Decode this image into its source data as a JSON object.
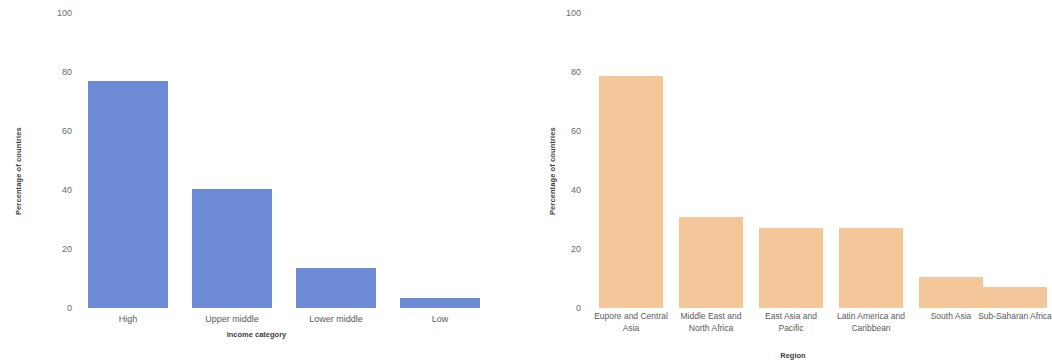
{
  "chart_data": [
    {
      "type": "bar",
      "title": "",
      "xlabel": "Income category",
      "ylabel": "Percentage of countries",
      "categories": [
        "High",
        "Upper middle",
        "Lower middle",
        "Low"
      ],
      "values": [
        77,
        40.5,
        13.5,
        3.5
      ],
      "ylim": [
        0,
        100
      ],
      "yticks": [
        0,
        20,
        40,
        60,
        80,
        100
      ],
      "ytick_labels": [
        "0",
        "20",
        "40",
        "60",
        "80",
        "100"
      ],
      "grid": false,
      "legend": "none",
      "bar_color": "#6c8bd4",
      "panel": "left"
    },
    {
      "type": "bar",
      "title": "",
      "xlabel": "Region",
      "ylabel": "Percentage of countries",
      "categories": [
        "Eupore and Central Asia",
        "Middle East and North Africa",
        "East Asia and Pacific",
        "Latin America and Caribbean",
        "South Asia",
        "Sub-Saharan Africa"
      ],
      "values": [
        78.5,
        31,
        27,
        27,
        10.5,
        7
      ],
      "ylim": [
        0,
        100
      ],
      "yticks": [
        0,
        20,
        40,
        60,
        80,
        100
      ],
      "ytick_labels": [
        "0",
        "20",
        "40",
        "60",
        "80",
        "100"
      ],
      "grid": false,
      "legend": "none",
      "bar_color": "#f4c79a",
      "panel": "right"
    }
  ],
  "left_chart": {
    "y_axis_title": "Percentage of countries",
    "x_axis_title": "Income category",
    "y_ticks": [
      {
        "label": "100"
      },
      {
        "label": "80"
      },
      {
        "label": "60"
      },
      {
        "label": "40"
      },
      {
        "label": "20"
      },
      {
        "label": "0"
      }
    ],
    "bars": [
      {
        "label": "High",
        "value": 77
      },
      {
        "label": "Upper middle",
        "value": 40.5
      },
      {
        "label": "Lower middle",
        "value": 13.5
      },
      {
        "label": "Low",
        "value": 3.5
      }
    ]
  },
  "right_chart": {
    "y_axis_title": "Percentage of countries",
    "x_axis_title": "Region",
    "y_ticks": [
      {
        "label": "100"
      },
      {
        "label": "80"
      },
      {
        "label": "60"
      },
      {
        "label": "40"
      },
      {
        "label": "20"
      },
      {
        "label": "0"
      }
    ],
    "bars": [
      {
        "label": "Eupore and Central Asia",
        "value": 78.5
      },
      {
        "label": "Middle East and North Africa",
        "value": 31
      },
      {
        "label": "East Asia and Pacific",
        "value": 27
      },
      {
        "label": "Latin America and Caribbean",
        "value": 27
      },
      {
        "label": "South Asia",
        "value": 10.5
      },
      {
        "label": "Sub-Saharan Africa",
        "value": 7
      }
    ]
  }
}
